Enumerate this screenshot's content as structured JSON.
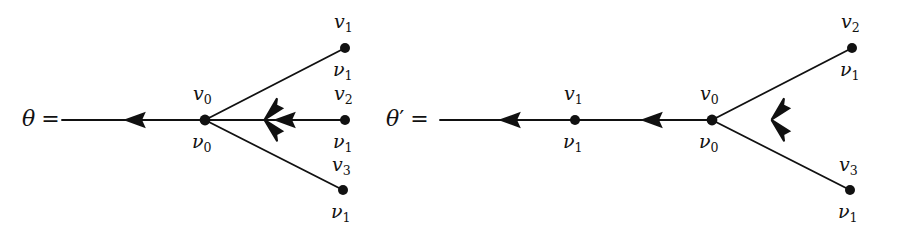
{
  "figure": {
    "type": "graph-diagram",
    "background_color": "#ffffff",
    "stroke_color": "#111111",
    "vertex_color": "#111111"
  },
  "diagrams": [
    {
      "id": "theta",
      "equation_label": {
        "symbol": "θ",
        "prime": "",
        "equals": "="
      },
      "root": {
        "top_label": {
          "base": "v",
          "sub": "0"
        },
        "bottom_label": {
          "base": "ν",
          "sub": "0"
        }
      },
      "leaves": [
        {
          "top_label": {
            "base": "v",
            "sub": "1"
          },
          "bottom_label": {
            "base": "ν",
            "sub": "1"
          }
        },
        {
          "top_label": {
            "base": "v",
            "sub": "2"
          },
          "bottom_label": {
            "base": "ν",
            "sub": "1"
          }
        },
        {
          "top_label": {
            "base": "v",
            "sub": "3"
          },
          "bottom_label": {
            "base": "ν",
            "sub": "1"
          }
        }
      ]
    },
    {
      "id": "theta-prime",
      "equation_label": {
        "symbol": "θ",
        "prime": "′",
        "equals": "="
      },
      "root": {
        "top_label": {
          "base": "v",
          "sub": "0"
        },
        "bottom_label": {
          "base": "ν",
          "sub": "0"
        }
      },
      "chain": [
        {
          "top_label": {
            "base": "v",
            "sub": "1"
          },
          "bottom_label": {
            "base": "ν",
            "sub": "1"
          }
        }
      ],
      "leaves": [
        {
          "top_label": {
            "base": "v",
            "sub": "2"
          },
          "bottom_label": {
            "base": "ν",
            "sub": "1"
          }
        },
        {
          "top_label": {
            "base": "v",
            "sub": "3"
          },
          "bottom_label": {
            "base": "ν",
            "sub": "1"
          }
        }
      ]
    }
  ]
}
